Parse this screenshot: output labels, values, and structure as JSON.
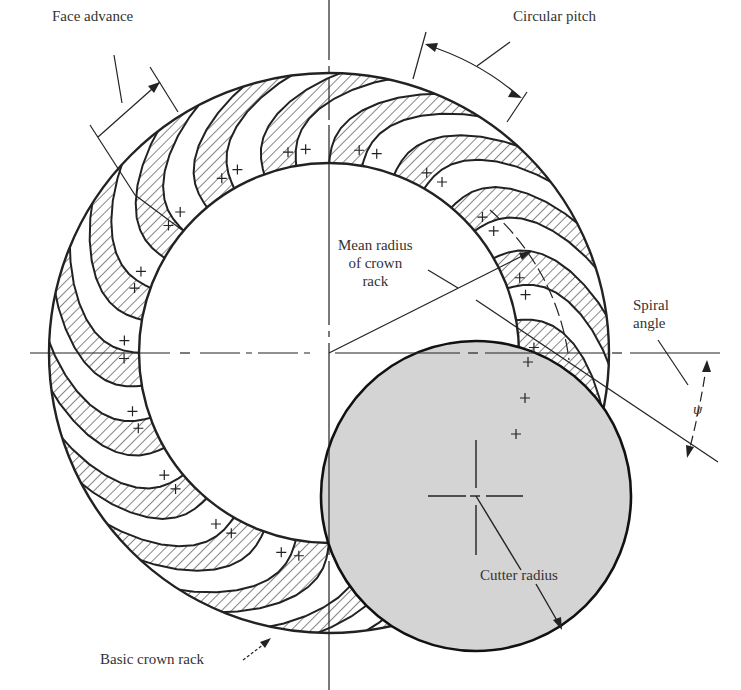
{
  "figure": {
    "type": "spiral bevel gear crown rack schematic",
    "colors": {
      "background": "#ffffff",
      "line": "#222222",
      "hatch": "#333333",
      "cutter_fill": "#d4d4d4"
    },
    "gear": {
      "cx": 329,
      "cy": 353,
      "outer_r": 280,
      "inner_r": 190,
      "tooth_count": 18
    },
    "cutter": {
      "cx": 476,
      "cy": 496,
      "r": 155
    }
  },
  "labels": {
    "face_advance": "Face advance",
    "circular_pitch": "Circular pitch",
    "mean_radius_line1": "Mean radius",
    "mean_radius_line2": "of crown",
    "mean_radius_line3": "rack",
    "spiral_angle_line1": "Spiral",
    "spiral_angle_line2": "angle",
    "psi_symbol": "ψ",
    "cutter_radius": "Cutter radius",
    "basic_crown_rack": "Basic crown rack"
  }
}
